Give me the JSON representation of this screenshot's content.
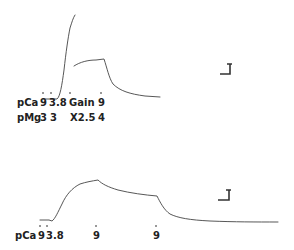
{
  "figure": {
    "panel_top": {
      "row1_label": "pCa",
      "row1_values": [
        "9",
        "3.8",
        "Gain",
        "9"
      ],
      "row2_label": "pMg",
      "row2_values": [
        "3",
        "3",
        "X2.5",
        "4"
      ],
      "events": [
        {
          "marker": "9",
          "note": "pCa 9"
        },
        {
          "marker": "3.8",
          "note": "pCa 3.8"
        },
        {
          "marker": "Gain",
          "note": "Gain X2.5"
        },
        {
          "marker": "9",
          "note": "pCa 9, pMg 4"
        }
      ]
    },
    "panel_bottom": {
      "row1_label": "pCa",
      "row1_values": [
        "9",
        "3.8",
        "9",
        "9"
      ]
    }
  }
}
